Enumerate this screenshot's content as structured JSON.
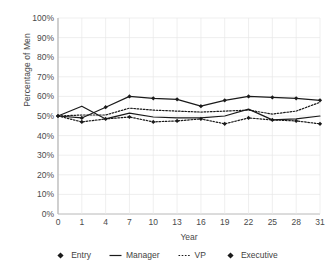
{
  "chart_data": {
    "type": "line",
    "title": "",
    "xlabel": "Year",
    "ylabel": "Percentage of Men",
    "categories": [
      "0",
      "1",
      "4",
      "7",
      "10",
      "13",
      "16",
      "19",
      "22",
      "25",
      "28",
      "31"
    ],
    "ylim": [
      0,
      100
    ],
    "y_ticks": [
      "0%",
      "10%",
      "20%",
      "30%",
      "40%",
      "50%",
      "60%",
      "70%",
      "80%",
      "90%",
      "100%"
    ],
    "y_tick_values": [
      0,
      10,
      20,
      30,
      40,
      50,
      60,
      70,
      80,
      90,
      100
    ],
    "grid": true,
    "legend_position": "bottom",
    "series": [
      {
        "name": "Entry",
        "style": "dotted-marker",
        "color": "#1a1a1a",
        "values": [
          50,
          47,
          48.5,
          49.5,
          47,
          47.5,
          48.5,
          46,
          49,
          48,
          47.5,
          46
        ]
      },
      {
        "name": "Manager",
        "style": "solid",
        "color": "#1a1a1a",
        "values": [
          50,
          55,
          48.5,
          51.5,
          49.5,
          49,
          49,
          50,
          53.5,
          48,
          48.5,
          50
        ]
      },
      {
        "name": "VP",
        "style": "dotted",
        "color": "#1a1a1a",
        "values": [
          50,
          50.5,
          50.5,
          54,
          53,
          52.5,
          52,
          52.5,
          53,
          51,
          52.5,
          57
        ]
      },
      {
        "name": "Executive",
        "style": "solid-marker",
        "color": "#1a1a1a",
        "values": [
          50,
          49,
          54.5,
          60,
          59,
          58.5,
          55,
          58,
          60,
          59.5,
          59,
          58
        ]
      }
    ]
  },
  "legend": {
    "items": [
      {
        "label": "Entry",
        "key": "diamond-marker"
      },
      {
        "label": "Manager",
        "key": "solid-line"
      },
      {
        "label": "VP",
        "key": "dotted-line"
      },
      {
        "label": "Executive",
        "key": "diamond-marker"
      }
    ]
  },
  "axes": {
    "y_title": "Percentage of Men",
    "x_title": "Year"
  },
  "colors": {
    "line": "#1a1a1a",
    "grid": "#e8e8e8",
    "axis": "#b0b0b0",
    "text": "#4a4a4a",
    "background": "#ffffff"
  }
}
